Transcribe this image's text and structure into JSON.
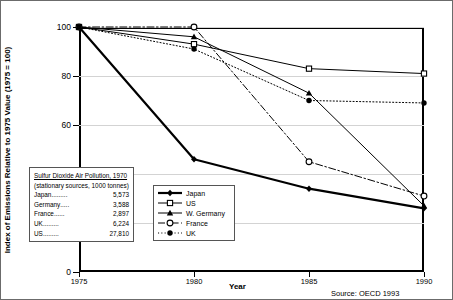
{
  "chart_data": {
    "type": "line",
    "title": "",
    "xlabel": "Year",
    "ylabel": "Index of Emissions Relative to 1975 Value (1975 = 100)",
    "x": [
      1975,
      1980,
      1985,
      1990
    ],
    "xlim": [
      1975,
      1990
    ],
    "ylim": [
      0,
      100
    ],
    "yticks": [
      0,
      20,
      40,
      60,
      80,
      100
    ],
    "xticks": [
      1975,
      1980,
      1985,
      1990
    ],
    "grid": true,
    "legend_position": "inside-lower-center",
    "source": "Source: OECD 1993",
    "series": [
      {
        "name": "Japan",
        "values": [
          100,
          46,
          34,
          26
        ],
        "style": "solid",
        "marker": "filled-diamond",
        "width": 2.2
      },
      {
        "name": "US",
        "values": [
          100,
          93,
          83,
          81
        ],
        "style": "solid",
        "marker": "open-square",
        "width": 1.0
      },
      {
        "name": "W. Germany",
        "values": [
          100,
          96,
          73,
          27
        ],
        "style": "solid",
        "marker": "filled-triangle",
        "width": 1.0
      },
      {
        "name": "France",
        "values": [
          100,
          100,
          45,
          31
        ],
        "style": "dash-dot",
        "marker": "open-circle",
        "width": 1.0
      },
      {
        "name": "UK",
        "values": [
          100,
          91,
          70,
          69
        ],
        "style": "dotted",
        "marker": "filled-circle",
        "width": 1.0
      }
    ]
  },
  "info_box": {
    "title": "Sulfur Dioxide Air Pollution, 1970",
    "subtitle": "(stationary sources, 1000 tonnes)",
    "rows": [
      {
        "name": "Japan",
        "dots": ".........",
        "value": "5,573"
      },
      {
        "name": "Germany",
        "dots": ".....",
        "value": "3,588"
      },
      {
        "name": "France",
        "dots": "......",
        "value": "2,897"
      },
      {
        "name": "UK",
        "dots": ".........",
        "value": "6,224"
      },
      {
        "name": "US",
        "dots": ".........",
        "value": "27,810"
      }
    ]
  },
  "legend": {
    "items": [
      {
        "label": "Japan"
      },
      {
        "label": "US"
      },
      {
        "label": "W. Germany"
      },
      {
        "label": "France"
      },
      {
        "label": "UK"
      }
    ]
  },
  "colors": {
    "line": "#000000",
    "grid": "#d3d3d3",
    "frame": "#000000",
    "box_border": "#555555"
  }
}
